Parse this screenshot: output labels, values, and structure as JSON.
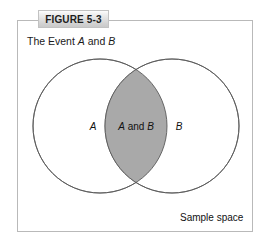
{
  "figure": {
    "tab_label": "FIGURE 5-3",
    "caption_prefix": "The Event ",
    "caption_event_a": "A",
    "caption_conjunction": " and ",
    "caption_event_b": "B"
  },
  "diagram": {
    "type": "venn",
    "set_a_label": "A",
    "set_b_label": "B",
    "intersection_label_a": "A",
    "intersection_label_and": " and ",
    "intersection_label_b": "B",
    "universe_label": "Sample space",
    "shaded_region": "intersection",
    "colors": {
      "circle_stroke": "#5a5a5a",
      "intersection_fill": "#a9a9a9",
      "circle_fill": "#ffffff",
      "frame_border": "#b9b9b9",
      "text": "#111111",
      "tab_text": "#1d1d1d"
    },
    "geometry": {
      "circle_a_cx": 100,
      "circle_a_cy": 126,
      "circle_b_cx": 172,
      "circle_b_cy": 126,
      "radius": 67
    }
  }
}
